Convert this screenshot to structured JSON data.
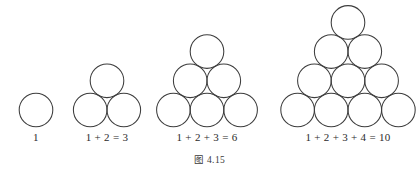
{
  "figure": {
    "caption": "图 4.15",
    "background_color": "#ffffff",
    "stroke_color": "#3d3d3d",
    "text_color": "#2b2b2b"
  },
  "groups": [
    {
      "id": "group-1",
      "label": "1",
      "rows": 1,
      "circle_count": 1,
      "label_x": 36,
      "label_y": 131
    },
    {
      "id": "group-2",
      "label": "1 + 2 = 3",
      "rows": 2,
      "circle_count": 3,
      "label_x": 107,
      "label_y": 131
    },
    {
      "id": "group-3",
      "label": "1 + 2 + 3 = 6",
      "rows": 3,
      "circle_count": 6,
      "label_x": 207,
      "label_y": 131
    },
    {
      "id": "group-4",
      "label": "1 + 2 + 3 + 4 = 10",
      "rows": 4,
      "circle_count": 10,
      "label_x": 348,
      "label_y": 131
    }
  ],
  "chart_data": {
    "type": "diagram",
    "title": "图 4.15",
    "categories": [
      "1",
      "1 + 2 = 3",
      "1 + 2 + 3 = 6",
      "1 + 2 + 3 + 4 = 10"
    ],
    "values": [
      1,
      3,
      6,
      10
    ],
    "rows_per_group": [
      1,
      2,
      3,
      4
    ],
    "xlabel": "",
    "ylabel": "",
    "grid": false,
    "legend": "none"
  },
  "geometry": {
    "circle_radius": 16.8,
    "row_spacing": 29.2,
    "baseline_y": 110,
    "group_centers": [
      36,
      107,
      207,
      348
    ]
  }
}
